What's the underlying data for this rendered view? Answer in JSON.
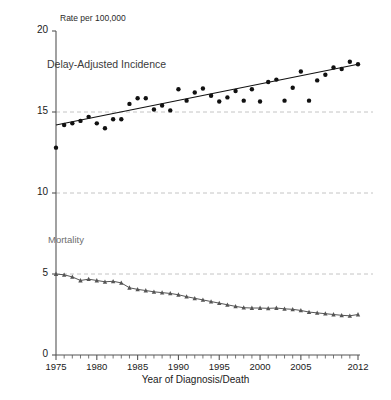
{
  "chart_data": {
    "type": "scatter",
    "title": "",
    "subtitle": "",
    "ylabel": "Rate per 100,000",
    "xlabel": "Year of Diagnosis/Death",
    "xlim": [
      1975,
      2012
    ],
    "ylim": [
      0,
      20
    ],
    "yticks": [
      0,
      5,
      10,
      15,
      20
    ],
    "ytick_labels": [
      "0",
      "5",
      "10",
      "15",
      "20"
    ],
    "xticks": [
      1975,
      1980,
      1985,
      1990,
      1995,
      2000,
      2005,
      2012
    ],
    "xtick_labels": [
      "1975",
      "1980",
      "1985",
      "1990",
      "1995",
      "2000",
      "2005",
      "2012"
    ],
    "xtick_minor_step": 1,
    "grid": "horizontal-dashed-at-5-10-15",
    "gridlines": [
      5,
      10,
      15
    ],
    "legend": "none",
    "annotations": [
      {
        "text": "Delay-Adjusted Incidence",
        "x": 1975.5,
        "y": 17.7
      },
      {
        "text": "Mortality",
        "x": 1975.5,
        "y": 6.9
      }
    ],
    "colors": {
      "incidence_marker": "#111111",
      "incidence_trend": "#111111",
      "mortality_marker": "#555555",
      "mortality_line": "#555555",
      "gridline": "#bdbdbd",
      "axis": "#555555",
      "text": "#1a1a1a"
    },
    "series": [
      {
        "name": "Delay-Adjusted Incidence",
        "marker": "circle",
        "x": [
          1975,
          1976,
          1977,
          1978,
          1979,
          1980,
          1981,
          1982,
          1983,
          1984,
          1985,
          1986,
          1987,
          1988,
          1989,
          1990,
          1991,
          1992,
          1993,
          1994,
          1995,
          1996,
          1997,
          1998,
          1999,
          2000,
          2001,
          2002,
          2003,
          2004,
          2005,
          2006,
          2007,
          2008,
          2009,
          2010,
          2011,
          2012
        ],
        "values": [
          12.8,
          14.2,
          14.3,
          14.45,
          14.7,
          14.3,
          14.0,
          14.55,
          14.55,
          15.5,
          15.85,
          15.85,
          15.15,
          15.4,
          15.1,
          16.4,
          15.7,
          16.2,
          16.45,
          16.0,
          15.65,
          15.9,
          16.3,
          15.7,
          16.4,
          15.65,
          16.85,
          17.0,
          15.7,
          16.5,
          17.5,
          15.7,
          16.95,
          17.3,
          17.75,
          17.65,
          18.1,
          17.95
        ]
      },
      {
        "name": "Incidence trend line",
        "type": "line",
        "x": [
          1975,
          2012
        ],
        "values": [
          14.2,
          17.95
        ]
      },
      {
        "name": "Mortality",
        "marker": "triangle",
        "x": [
          1975,
          1976,
          1977,
          1978,
          1979,
          1980,
          1981,
          1982,
          1983,
          1984,
          1985,
          1986,
          1987,
          1988,
          1989,
          1990,
          1991,
          1992,
          1993,
          1994,
          1995,
          1996,
          1997,
          1998,
          1999,
          2000,
          2001,
          2002,
          2003,
          2004,
          2005,
          2006,
          2007,
          2008,
          2009,
          2010,
          2011,
          2012
        ],
        "values": [
          5.0,
          4.95,
          4.82,
          4.6,
          4.68,
          4.6,
          4.52,
          4.55,
          4.45,
          4.15,
          4.05,
          3.98,
          3.9,
          3.85,
          3.8,
          3.72,
          3.6,
          3.5,
          3.4,
          3.3,
          3.2,
          3.1,
          3.0,
          2.92,
          2.9,
          2.9,
          2.88,
          2.9,
          2.85,
          2.82,
          2.75,
          2.65,
          2.6,
          2.55,
          2.5,
          2.45,
          2.42,
          2.5
        ]
      }
    ]
  },
  "labels": {
    "rate_axis_caption": "Rate per 100,000",
    "x_axis_caption": "Year of Diagnosis/Death",
    "incidence_caption": "Delay-Adjusted Incidence",
    "mortality_caption": "Mortality"
  }
}
